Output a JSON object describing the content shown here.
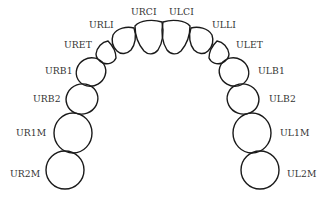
{
  "diagram": {
    "stroke_color": "#1a1a1a",
    "label_color": "#333333",
    "teeth": [
      {
        "id": "URCI",
        "label": "URCI",
        "side": "right",
        "type": "central-incisor"
      },
      {
        "id": "ULCI",
        "label": "ULCI",
        "side": "left",
        "type": "central-incisor"
      },
      {
        "id": "URLI",
        "label": "URLI",
        "side": "right",
        "type": "lateral-incisor"
      },
      {
        "id": "ULLI",
        "label": "ULLI",
        "side": "left",
        "type": "lateral-incisor"
      },
      {
        "id": "URET",
        "label": "URET",
        "side": "right",
        "type": "canine"
      },
      {
        "id": "ULET",
        "label": "ULET",
        "side": "left",
        "type": "canine"
      },
      {
        "id": "URB1",
        "label": "URB1",
        "side": "right",
        "type": "first-premolar"
      },
      {
        "id": "ULB1",
        "label": "ULB1",
        "side": "left",
        "type": "first-premolar"
      },
      {
        "id": "URB2",
        "label": "URB2",
        "side": "right",
        "type": "second-premolar"
      },
      {
        "id": "ULB2",
        "label": "ULB2",
        "side": "left",
        "type": "second-premolar"
      },
      {
        "id": "UR1M",
        "label": "UR1M",
        "side": "right",
        "type": "first-molar"
      },
      {
        "id": "UL1M",
        "label": "UL1M",
        "side": "left",
        "type": "first-molar"
      },
      {
        "id": "UR2M",
        "label": "UR2M",
        "side": "right",
        "type": "second-molar"
      },
      {
        "id": "UL2M",
        "label": "UL2M",
        "side": "left",
        "type": "second-molar"
      }
    ]
  }
}
